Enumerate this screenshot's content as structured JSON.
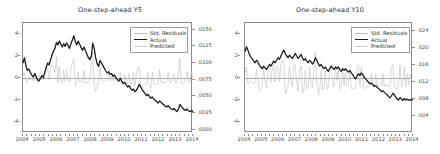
{
  "figure": {
    "panel_count": 2,
    "background": "#ffffff",
    "colors": {
      "actual": "#1a1a1a",
      "predicted": "#c9c9c9",
      "residuals": "#bdbdbd",
      "frame": "#8a8a8a",
      "zero_line": "#a9a9a9",
      "text": "#2b2b2b"
    }
  },
  "legend": {
    "items": [
      {
        "label": "Std. Residuals",
        "color": "#bdbdbd",
        "swatch": "thin-line"
      },
      {
        "label": "Actual",
        "color": "#1a1a1a",
        "swatch": "thick-line"
      },
      {
        "label": "Predicted",
        "color": "#c9c9c9",
        "swatch": "thin-line"
      }
    ]
  },
  "chart_data": [
    {
      "type": "line",
      "id": "one-step-ahead-y5",
      "title": "One-step-ahead  Y5",
      "xlabel": "",
      "ylabel": "",
      "grid": false,
      "legend_position": "top-right",
      "x": [
        "2004",
        "2005",
        "2006",
        "2007",
        "2008",
        "2009",
        "2010",
        "2011",
        "2012",
        "2013",
        "2014"
      ],
      "xlim": [
        2004,
        2014
      ],
      "xticks": [
        "2004",
        "2005",
        "2006",
        "2007",
        "2008",
        "2009",
        "2010",
        "2011",
        "2012",
        "2013",
        "2014"
      ],
      "left_axis": {
        "label": "Std. Residuals",
        "ticks": [
          "4",
          "2",
          "0",
          "-2",
          "-4"
        ],
        "values": [
          4,
          2,
          0,
          -2,
          -4
        ],
        "ylim": [
          -5,
          5
        ]
      },
      "right_axis": {
        "label": "Yield",
        "ticks": [
          ".0150",
          ".0125",
          ".0100",
          ".0075",
          ".0050",
          ".0025",
          ".0000"
        ],
        "values": [
          0.015,
          0.0125,
          0.01,
          0.0075,
          0.005,
          0.0025,
          0.0
        ],
        "ylim": [
          -0.0005,
          0.016
        ]
      },
      "series": [
        {
          "name": "Actual",
          "axis": "right",
          "color": "#1a1a1a",
          "values": [
            0.01,
            0.0108,
            0.0096,
            0.0089,
            0.0091,
            0.0086,
            0.0082,
            0.0079,
            0.0084,
            0.008,
            0.0075,
            0.0073,
            0.0077,
            0.0081,
            0.0078,
            0.0086,
            0.0094,
            0.01,
            0.0097,
            0.0105,
            0.0112,
            0.0118,
            0.0122,
            0.0131,
            0.0127,
            0.0133,
            0.0128,
            0.0124,
            0.0129,
            0.0125,
            0.013,
            0.0126,
            0.0122,
            0.0129,
            0.0135,
            0.0141,
            0.0132,
            0.0127,
            0.0133,
            0.0128,
            0.0123,
            0.0119,
            0.0124,
            0.0118,
            0.0113,
            0.0108,
            0.0105,
            0.011,
            0.013,
            0.0122,
            0.0108,
            0.0099,
            0.0095,
            0.0104,
            0.01,
            0.0096,
            0.0092,
            0.0088,
            0.0085,
            0.0087,
            0.0083,
            0.0084,
            0.008,
            0.0082,
            0.0078,
            0.0075,
            0.0073,
            0.0077,
            0.0072,
            0.0069,
            0.0071,
            0.0067,
            0.0064,
            0.0066,
            0.0062,
            0.0059,
            0.0061,
            0.0057,
            0.0059,
            0.0063,
            0.0068,
            0.0064,
            0.006,
            0.0057,
            0.0054,
            0.0051,
            0.0053,
            0.005,
            0.0047,
            0.0049,
            0.0046,
            0.0044,
            0.0042,
            0.004,
            0.0043,
            0.0041,
            0.0039,
            0.0037,
            0.0035,
            0.0034,
            0.0036,
            0.0033,
            0.0031,
            0.003,
            0.0032,
            0.0029,
            0.0027,
            0.0031,
            0.0038,
            0.0035,
            0.0032,
            0.003,
            0.0029,
            0.0031,
            0.0028,
            0.0027,
            0.0029,
            0.0027
          ]
        },
        {
          "name": "Predicted",
          "axis": "right",
          "color": "#c9c9c9",
          "values": [
            0.0099,
            0.0106,
            0.0097,
            0.009,
            0.009,
            0.0087,
            0.0082,
            0.008,
            0.0083,
            0.0081,
            0.0076,
            0.0074,
            0.0076,
            0.008,
            0.0079,
            0.0085,
            0.0092,
            0.0099,
            0.0098,
            0.0104,
            0.011,
            0.0117,
            0.0122,
            0.0129,
            0.0128,
            0.0131,
            0.0129,
            0.0125,
            0.0128,
            0.0126,
            0.0129,
            0.0127,
            0.0123,
            0.0128,
            0.0134,
            0.0139,
            0.0134,
            0.0128,
            0.0132,
            0.0129,
            0.0124,
            0.012,
            0.0123,
            0.0119,
            0.0114,
            0.0109,
            0.0106,
            0.0109,
            0.0126,
            0.0123,
            0.011,
            0.0101,
            0.0096,
            0.0102,
            0.0101,
            0.0097,
            0.0093,
            0.0089,
            0.0086,
            0.0086,
            0.0084,
            0.0083,
            0.0081,
            0.0081,
            0.0079,
            0.0076,
            0.0074,
            0.0076,
            0.0073,
            0.007,
            0.007,
            0.0068,
            0.0065,
            0.0065,
            0.0063,
            0.006,
            0.006,
            0.0058,
            0.0058,
            0.0062,
            0.0066,
            0.0065,
            0.0061,
            0.0058,
            0.0055,
            0.0052,
            0.0052,
            0.0051,
            0.0048,
            0.0048,
            0.0047,
            0.0045,
            0.0043,
            0.0041,
            0.0042,
            0.0042,
            0.004,
            0.0038,
            0.0036,
            0.0035,
            0.0035,
            0.0034,
            0.0032,
            0.0031,
            0.0031,
            0.003,
            0.0028,
            0.003,
            0.0036,
            0.0036,
            0.0033,
            0.0031,
            0.003,
            0.003,
            0.0029,
            0.0028,
            0.0028,
            0.0028
          ]
        },
        {
          "name": "Std. Residuals",
          "axis": "left",
          "color": "#bdbdbd",
          "values": [
            0.2,
            0.5,
            -0.3,
            -0.4,
            0.1,
            -0.2,
            0.0,
            -0.3,
            0.4,
            -0.2,
            -0.3,
            -0.1,
            0.6,
            0.5,
            -0.2,
            0.4,
            1.1,
            0.8,
            -0.2,
            0.9,
            1.2,
            0.9,
            0.5,
            1.9,
            -0.4,
            1.0,
            -0.3,
            -0.5,
            0.7,
            -0.3,
            0.8,
            -0.2,
            -0.4,
            1.0,
            1.3,
            1.7,
            -0.7,
            -0.5,
            0.6,
            -0.4,
            -0.3,
            -0.4,
            0.7,
            -0.4,
            -0.4,
            -0.5,
            -0.2,
            1.2,
            2.3,
            -0.6,
            -1.2,
            -0.8,
            -0.3,
            1.0,
            -0.2,
            -0.3,
            -0.3,
            -0.3,
            -0.2,
            0.4,
            -0.3,
            0.2,
            -0.3,
            0.3,
            -0.3,
            -0.4,
            -0.2,
            0.5,
            -0.4,
            -0.4,
            0.3,
            -0.5,
            -0.6,
            0.4,
            -0.5,
            -0.6,
            0.5,
            -0.7,
            0.4,
            0.9,
            1.0,
            -0.8,
            -0.9,
            -0.6,
            -0.5,
            -0.6,
            0.5,
            -0.6,
            -0.9,
            0.5,
            -0.6,
            -0.6,
            -0.5,
            -0.5,
            0.8,
            -0.4,
            -0.4,
            -0.4,
            -0.4,
            -0.2,
            0.5,
            -0.4,
            -0.4,
            -0.3,
            0.4,
            -0.5,
            -0.4,
            0.5,
            1.8,
            -0.5,
            -0.6,
            -0.4,
            -0.2,
            0.6,
            -0.4,
            -0.2,
            0.6,
            -0.2
          ]
        }
      ]
    },
    {
      "type": "line",
      "id": "one-step-ahead-y10",
      "title": "One-step-ahead  Y10",
      "xlabel": "",
      "ylabel": "",
      "grid": false,
      "legend_position": "top-right",
      "x": [
        "2004",
        "2005",
        "2006",
        "2007",
        "2008",
        "2009",
        "2010",
        "2011",
        "2012",
        "2013",
        "2014"
      ],
      "xlim": [
        2004,
        2014
      ],
      "xticks": [
        "2004",
        "2005",
        "2006",
        "2007",
        "2008",
        "2009",
        "2010",
        "2011",
        "2012",
        "2013",
        "2014"
      ],
      "left_axis": {
        "label": "Std. Residuals",
        "ticks": [
          "4",
          "2",
          "0",
          "-2",
          "-4"
        ],
        "values": [
          4,
          2,
          0,
          -2,
          -4
        ],
        "ylim": [
          -5,
          5
        ]
      },
      "right_axis": {
        "label": "Yield",
        "ticks": [
          ".024",
          ".020",
          ".016",
          ".012",
          ".008",
          ".004"
        ],
        "values": [
          0.024,
          0.02,
          0.016,
          0.012,
          0.008,
          0.004
        ],
        "ylim": [
          0.0,
          0.026
        ]
      },
      "series": [
        {
          "name": "Actual",
          "axis": "right",
          "color": "#1a1a1a",
          "values": [
            0.0192,
            0.0204,
            0.0196,
            0.0186,
            0.018,
            0.0176,
            0.017,
            0.0166,
            0.0172,
            0.0168,
            0.016,
            0.0156,
            0.0152,
            0.0158,
            0.0154,
            0.015,
            0.0156,
            0.0162,
            0.0158,
            0.0164,
            0.017,
            0.0166,
            0.0172,
            0.0178,
            0.0174,
            0.0182,
            0.019,
            0.0196,
            0.0188,
            0.0182,
            0.0178,
            0.0184,
            0.018,
            0.0176,
            0.0182,
            0.0188,
            0.0182,
            0.0176,
            0.018,
            0.0186,
            0.0178,
            0.0172,
            0.0176,
            0.017,
            0.0166,
            0.0172,
            0.0168,
            0.0163,
            0.0168,
            0.0178,
            0.0172,
            0.0164,
            0.0158,
            0.0162,
            0.0156,
            0.0152,
            0.0156,
            0.015,
            0.0146,
            0.0152,
            0.0158,
            0.0154,
            0.015,
            0.0156,
            0.0152,
            0.0156,
            0.015,
            0.0146,
            0.0152,
            0.0148,
            0.0152,
            0.0148,
            0.0144,
            0.0148,
            0.0142,
            0.0138,
            0.0132,
            0.0128,
            0.0134,
            0.014,
            0.0136,
            0.0142,
            0.0138,
            0.0132,
            0.0128,
            0.0124,
            0.012,
            0.0116,
            0.0118,
            0.0114,
            0.011,
            0.0112,
            0.0108,
            0.0105,
            0.0102,
            0.0098,
            0.01,
            0.0096,
            0.0093,
            0.009,
            0.0086,
            0.0083,
            0.0088,
            0.0094,
            0.009,
            0.0085,
            0.008,
            0.0078,
            0.0084,
            0.008,
            0.0077,
            0.0082,
            0.0078,
            0.008,
            0.0077,
            0.0079,
            0.0078,
            0.0079
          ]
        },
        {
          "name": "Predicted",
          "axis": "right",
          "color": "#c9c9c9",
          "values": [
            0.019,
            0.0201,
            0.0197,
            0.0187,
            0.0181,
            0.0177,
            0.0171,
            0.0167,
            0.017,
            0.0169,
            0.0162,
            0.0157,
            0.0153,
            0.0156,
            0.0155,
            0.0151,
            0.0154,
            0.016,
            0.0159,
            0.0162,
            0.0168,
            0.0167,
            0.017,
            0.0176,
            0.0175,
            0.018,
            0.0187,
            0.0194,
            0.019,
            0.0184,
            0.0179,
            0.0182,
            0.0181,
            0.0177,
            0.018,
            0.0186,
            0.0184,
            0.0178,
            0.0179,
            0.0184,
            0.018,
            0.0174,
            0.0175,
            0.0171,
            0.0167,
            0.017,
            0.0169,
            0.0164,
            0.0166,
            0.0175,
            0.0174,
            0.0166,
            0.0159,
            0.016,
            0.0158,
            0.0153,
            0.0154,
            0.0152,
            0.0147,
            0.015,
            0.0156,
            0.0155,
            0.0151,
            0.0154,
            0.0153,
            0.0154,
            0.0152,
            0.0147,
            0.015,
            0.0149,
            0.015,
            0.0149,
            0.0145,
            0.0146,
            0.0144,
            0.0139,
            0.0134,
            0.0129,
            0.0132,
            0.0138,
            0.0137,
            0.014,
            0.0139,
            0.0134,
            0.0129,
            0.0125,
            0.0121,
            0.0117,
            0.0117,
            0.0115,
            0.0111,
            0.0111,
            0.0109,
            0.0106,
            0.0103,
            0.0099,
            0.0099,
            0.0097,
            0.0094,
            0.0091,
            0.0087,
            0.0084,
            0.0086,
            0.0092,
            0.0091,
            0.0086,
            0.0081,
            0.0079,
            0.0082,
            0.0081,
            0.0078,
            0.008,
            0.0079,
            0.0079,
            0.0078,
            0.0078,
            0.0078,
            0.0078
          ]
        },
        {
          "name": "Std. Residuals",
          "axis": "left",
          "color": "#bdbdbd",
          "values": [
            0.4,
            1.0,
            -0.5,
            -0.4,
            -0.3,
            -0.4,
            -0.5,
            -0.4,
            0.8,
            -0.3,
            -1.2,
            -1.0,
            -0.8,
            1.0,
            -0.3,
            -0.9,
            0.7,
            1.0,
            -0.4,
            0.8,
            1.2,
            -0.4,
            0.9,
            1.1,
            -0.3,
            1.3,
            1.6,
            1.2,
            -1.4,
            -1.0,
            -0.7,
            1.0,
            -0.3,
            -0.8,
            1.0,
            1.2,
            -0.5,
            -1.2,
            0.6,
            1.1,
            -1.4,
            -1.1,
            0.7,
            -1.0,
            -0.8,
            1.0,
            -0.7,
            -0.9,
            0.8,
            2.4,
            -0.4,
            -1.5,
            -1.1,
            0.7,
            -1.1,
            -0.9,
            0.7,
            -1.0,
            -0.8,
            1.0,
            1.2,
            -0.7,
            -0.8,
            1.0,
            -0.2,
            0.8,
            -1.0,
            -0.8,
            1.0,
            -0.7,
            0.8,
            -0.7,
            -0.7,
            0.7,
            -1.0,
            -0.9,
            -1.0,
            -0.9,
            1.0,
            1.2,
            -0.7,
            1.0,
            -0.2,
            -1.0,
            -0.9,
            -0.8,
            -0.8,
            -0.8,
            0.4,
            -0.7,
            -0.8,
            0.4,
            -0.8,
            -0.6,
            -0.6,
            -0.7,
            0.4,
            -0.8,
            -0.6,
            -0.6,
            -0.8,
            -0.7,
            1.0,
            1.2,
            -0.8,
            -1.0,
            -1.0,
            -0.4,
            1.2,
            -0.8,
            -0.6,
            1.0,
            -0.8,
            0.4,
            -0.6,
            0.3,
            -0.2,
            0.2
          ]
        }
      ]
    }
  ]
}
